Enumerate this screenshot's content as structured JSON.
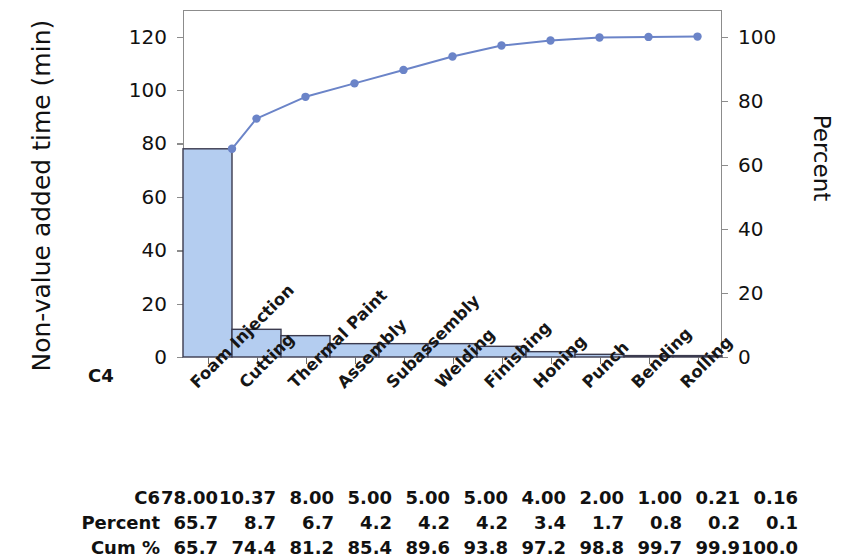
{
  "chart_data": {
    "type": "bar",
    "title": "",
    "subtitle": "",
    "xlabel": "C4",
    "ylabel": "Non-value added time (min)",
    "y2label": "Percent",
    "categories": [
      "Foam Injection",
      "Cutting",
      "Thermal Paint",
      "Assembly",
      "Subassembly",
      "Welding",
      "Finishing",
      "Honing",
      "Punch",
      "Bending",
      "Rolling"
    ],
    "values": [
      78.0,
      10.37,
      8.0,
      5.0,
      5.0,
      5.0,
      4.0,
      2.0,
      1.0,
      0.21,
      0.16
    ],
    "percent": [
      65.7,
      8.7,
      6.7,
      4.2,
      4.2,
      4.2,
      3.4,
      1.7,
      0.8,
      0.2,
      0.1
    ],
    "cumulative_percent": [
      65.7,
      74.4,
      81.2,
      85.4,
      89.6,
      93.8,
      97.2,
      98.8,
      99.7,
      99.9,
      100.0
    ],
    "series": [
      {
        "name": "C6",
        "type": "bar",
        "values": [
          78.0,
          10.37,
          8.0,
          5.0,
          5.0,
          5.0,
          4.0,
          2.0,
          1.0,
          0.21,
          0.16
        ]
      },
      {
        "name": "Cum %",
        "type": "line",
        "values": [
          65.7,
          74.4,
          81.2,
          85.4,
          89.6,
          93.8,
          97.2,
          98.8,
          99.7,
          99.9,
          100.0
        ]
      }
    ],
    "ylim": [
      0,
      130
    ],
    "y2lim": [
      0,
      108.3
    ],
    "yticks": [
      0,
      20,
      40,
      60,
      80,
      100,
      120
    ],
    "y2ticks": [
      0,
      20,
      40,
      60,
      80,
      100
    ],
    "grid": false,
    "legend": false,
    "colors": {
      "bar_fill": "#b4cdf0",
      "bar_edge": "#3b3b4f",
      "line": "#6b84c8",
      "marker": "#6b84c8",
      "axis": "#8c8c8c",
      "text": "#111111"
    }
  },
  "axes": {
    "y_title": "Non-value added time (min)",
    "y2_title": "Percent",
    "y_ticklabels": [
      "120",
      "100",
      "80",
      "60",
      "40",
      "20",
      "0"
    ],
    "y2_ticklabels": [
      "100",
      "80",
      "60",
      "40",
      "20",
      "0"
    ],
    "group_label": "C4"
  },
  "table": {
    "rows": [
      {
        "label": "C6",
        "values": [
          "78.00",
          "10.37",
          "8.00",
          "5.00",
          "5.00",
          "5.00",
          "4.00",
          "2.00",
          "1.00",
          "0.21",
          "0.16"
        ]
      },
      {
        "label": "Percent",
        "values": [
          "65.7",
          "8.7",
          "6.7",
          "4.2",
          "4.2",
          "4.2",
          "3.4",
          "1.7",
          "0.8",
          "0.2",
          "0.1"
        ]
      },
      {
        "label": "Cum %",
        "values": [
          "65.7",
          "74.4",
          "81.2",
          "85.4",
          "89.6",
          "93.8",
          "97.2",
          "98.8",
          "99.7",
          "99.9",
          "100.0"
        ]
      }
    ]
  }
}
